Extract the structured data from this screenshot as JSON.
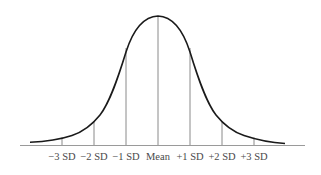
{
  "diagram": {
    "type": "normal-distribution",
    "colors": {
      "curve": "#1a1a1a",
      "lines": "#7a7a7a",
      "axis": "#9a9a9a",
      "text": "#4a4a4a"
    },
    "labels": [
      {
        "id": "m3",
        "text": "−3 SD",
        "x": 62
      },
      {
        "id": "m2",
        "text": "−2 SD",
        "x": 94
      },
      {
        "id": "m1",
        "text": "−1 SD",
        "x": 126
      },
      {
        "id": "mean",
        "text": "Mean",
        "x": 158
      },
      {
        "id": "p1",
        "text": "+1 SD",
        "x": 190
      },
      {
        "id": "p2",
        "text": "+2 SD",
        "x": 222
      },
      {
        "id": "p3",
        "text": "+3 SD",
        "x": 254
      }
    ]
  }
}
